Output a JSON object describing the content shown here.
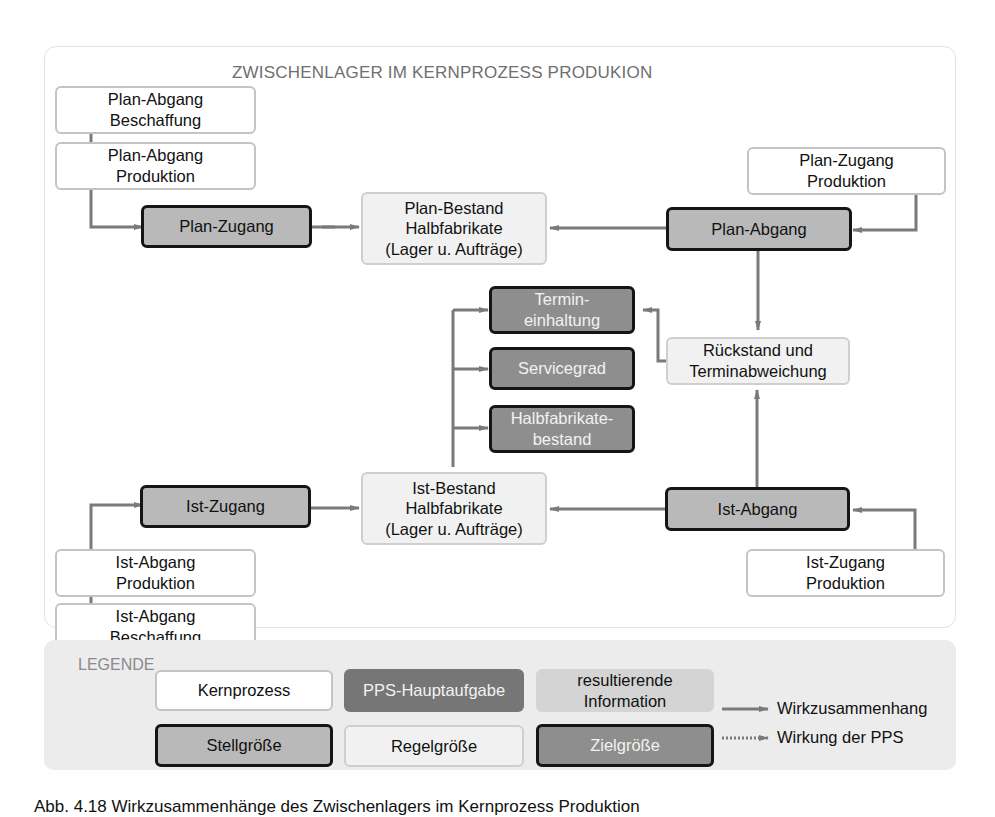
{
  "diagram": {
    "title": "ZWISCHENLAGER IM KERNPROZESS PRODUKION",
    "nodes": {
      "plan_abgang_beschaffung": "Plan-Abgang\nBeschaffung",
      "plan_abgang_produktion": "Plan-Abgang\nProduktion",
      "plan_zugang": "Plan-Zugang",
      "plan_bestand": "Plan-Bestand\nHalbfabrikate\n(Lager u. Aufträge)",
      "plan_abgang": "Plan-Abgang",
      "plan_zugang_produktion": "Plan-Zugang\nProduktion",
      "termineinhaltung": "Termin-\neinhaltung",
      "servicegrad": "Servicegrad",
      "halbfabrikatebestand": "Halbfabrikate-\nbestand",
      "rueckstand": "Rückstand und\nTerminabweichung",
      "ist_zugang": "Ist-Zugang",
      "ist_bestand": "Ist-Bestand\nHalbfabrikate\n(Lager u. Aufträge)",
      "ist_abgang": "Ist-Abgang",
      "ist_abgang_produktion": "Ist-Abgang\nProduktion",
      "ist_abgang_beschaffung": "Ist-Abgang\nBeschaffung",
      "ist_zugang_produktion": "Ist-Zugang\nProduktion"
    }
  },
  "legend": {
    "label": "LEGENDE",
    "kernprozess": "Kernprozess",
    "pps_hauptaufgabe": "PPS-Hauptaufgabe",
    "resultierende_information": "resultierende\nInformation",
    "stellgroesse": "Stellgröße",
    "regelgroesse": "Regelgröße",
    "zielgroesse": "Zielgröße",
    "wirkzusammenhang": "Wirkzusammenhang",
    "wirkung_pps": "Wirkung der PPS"
  },
  "colors": {
    "arrow": "#7a7a7a",
    "stell_fill": "#b9b9b9",
    "ziel_fill": "#8e8e8e",
    "pps_fill": "#767676",
    "regel_fill": "#f1f1f1",
    "info_fill": "#d4d4d4"
  },
  "caption": "Abb. 4.18 Wirkzusammenhänge des Zwischenlagers im Kernprozess Produktion"
}
